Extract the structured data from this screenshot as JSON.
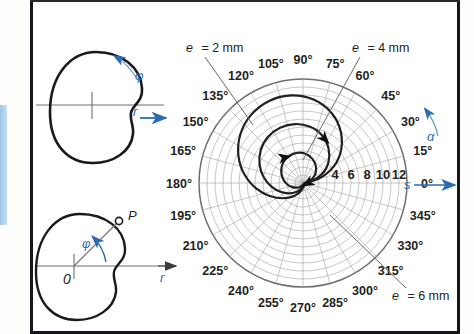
{
  "figure": {
    "title_hidden": "",
    "background": "#ffffff",
    "frame_color": "#16161a",
    "accent_blue": "#2b6cb0",
    "curve_color": "#231f20",
    "grid_color": "#a9a9ac"
  },
  "cam_top": {
    "name": "cam-disc-top",
    "rotation_symbol": "φ",
    "radius_axis_symbol": "r",
    "axis_arrow": "right-arrow"
  },
  "cam_bottom": {
    "name": "cam-disc-bottom",
    "angle_symbol": "φ",
    "radius_axis_symbol": "r",
    "origin_label": "0",
    "point_label": "P",
    "axis_arrow": "right-arrow"
  },
  "polar": {
    "name": "polar-cam-displacement-diagram",
    "alpha_symbol": "α",
    "s_symbol": "s",
    "radial_ticks": [
      "4",
      "6",
      "8",
      "10",
      "12"
    ],
    "radial_unit_hidden": "mm",
    "angle_labels": [
      "0°",
      "15°",
      "30°",
      "45°",
      "60°",
      "75°",
      "90°",
      "105°",
      "120°",
      "135°",
      "150°",
      "165°",
      "180°",
      "195°",
      "210°",
      "225°",
      "240°",
      "255°",
      "270°",
      "285°",
      "300°",
      "315°",
      "330°",
      "345°"
    ],
    "callouts": [
      {
        "id": "e2",
        "text_italic": "e",
        "text_rest": "= 2 mm"
      },
      {
        "id": "e4",
        "text_italic": "e",
        "text_rest": "= 4 mm"
      },
      {
        "id": "e6",
        "text_italic": "e",
        "text_rest": "= 6 mm"
      }
    ]
  },
  "chart_data": {
    "type": "line",
    "coordinate_system": "polar",
    "title": "",
    "xlabel": "α",
    "ylabel": "s",
    "angle_unit": "degrees",
    "radial_unit": "mm",
    "radial_ticks": [
      4,
      6,
      8,
      10,
      12
    ],
    "radial_range": [
      0,
      13
    ],
    "angle_ticks": [
      0,
      15,
      30,
      45,
      60,
      75,
      90,
      105,
      120,
      135,
      150,
      165,
      180,
      195,
      210,
      225,
      240,
      255,
      270,
      285,
      300,
      315,
      330,
      345
    ],
    "grid": true,
    "legend_position": "callout-labels",
    "series": [
      {
        "name": "e = 2 mm",
        "eccentricity_mm": 2,
        "annotation": "e = 2 mm",
        "description": "inner spiral, smallest eccentricity",
        "points_deg_mm": [
          [
            0,
            0.2
          ],
          [
            15,
            0.9
          ],
          [
            30,
            1.7
          ],
          [
            45,
            2.4
          ],
          [
            60,
            3.0
          ],
          [
            75,
            3.5
          ],
          [
            90,
            3.8
          ],
          [
            105,
            3.9
          ],
          [
            120,
            3.8
          ],
          [
            135,
            3.6
          ],
          [
            150,
            3.2
          ],
          [
            165,
            2.7
          ],
          [
            180,
            2.2
          ],
          [
            195,
            1.7
          ],
          [
            210,
            1.2
          ],
          [
            225,
            0.8
          ],
          [
            240,
            0.5
          ],
          [
            255,
            0.3
          ],
          [
            270,
            0.2
          ],
          [
            285,
            0.15
          ],
          [
            300,
            0.15
          ],
          [
            315,
            0.15
          ],
          [
            330,
            0.15
          ],
          [
            345,
            0.15
          ],
          [
            360,
            0.2
          ]
        ]
      },
      {
        "name": "e = 4 mm",
        "eccentricity_mm": 4,
        "annotation": "e = 4 mm",
        "description": "middle spiral",
        "points_deg_mm": [
          [
            0,
            0.3
          ],
          [
            15,
            1.8
          ],
          [
            30,
            3.4
          ],
          [
            45,
            4.8
          ],
          [
            60,
            6.0
          ],
          [
            75,
            6.9
          ],
          [
            90,
            7.4
          ],
          [
            105,
            7.6
          ],
          [
            120,
            7.5
          ],
          [
            135,
            7.1
          ],
          [
            150,
            6.4
          ],
          [
            165,
            5.5
          ],
          [
            180,
            4.5
          ],
          [
            195,
            3.5
          ],
          [
            210,
            2.6
          ],
          [
            225,
            1.8
          ],
          [
            240,
            1.2
          ],
          [
            255,
            0.7
          ],
          [
            270,
            0.4
          ],
          [
            285,
            0.25
          ],
          [
            300,
            0.2
          ],
          [
            315,
            0.2
          ],
          [
            330,
            0.2
          ],
          [
            345,
            0.25
          ],
          [
            360,
            0.3
          ]
        ]
      },
      {
        "name": "e = 6 mm",
        "eccentricity_mm": 6,
        "annotation": "e = 6 mm",
        "description": "outer spiral, largest eccentricity",
        "points_deg_mm": [
          [
            0,
            0.4
          ],
          [
            15,
            2.6
          ],
          [
            30,
            5.0
          ],
          [
            45,
            7.1
          ],
          [
            60,
            8.9
          ],
          [
            75,
            10.2
          ],
          [
            90,
            11.0
          ],
          [
            105,
            11.3
          ],
          [
            120,
            11.1
          ],
          [
            135,
            10.5
          ],
          [
            150,
            9.5
          ],
          [
            165,
            8.2
          ],
          [
            180,
            6.7
          ],
          [
            195,
            5.2
          ],
          [
            210,
            3.8
          ],
          [
            225,
            2.7
          ],
          [
            240,
            1.8
          ],
          [
            255,
            1.1
          ],
          [
            270,
            0.6
          ],
          [
            285,
            0.4
          ],
          [
            300,
            0.3
          ],
          [
            315,
            0.3
          ],
          [
            330,
            0.3
          ],
          [
            345,
            0.35
          ],
          [
            360,
            0.4
          ]
        ]
      }
    ]
  }
}
